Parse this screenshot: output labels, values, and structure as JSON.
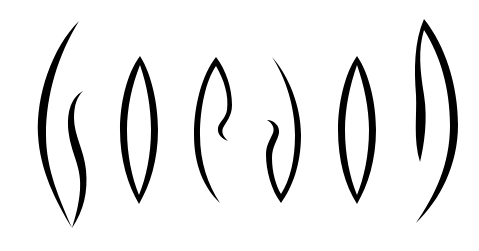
{
  "artwork": {
    "type": "stylized calligraphic letterforms",
    "glyph_count": 6,
    "glyphs": [
      "swirl-left",
      "lens",
      "hook-right",
      "hook-left",
      "lens",
      "swirl-right"
    ],
    "colors": {
      "ink": "#000000",
      "background": "#ffffff"
    }
  }
}
